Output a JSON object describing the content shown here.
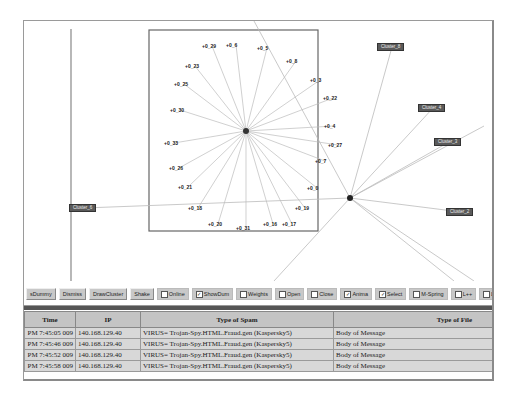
{
  "graph": {
    "center_node": {
      "x": 222,
      "y": 110
    },
    "hub_node": {
      "x": 326,
      "y": 177
    },
    "inner_box": {
      "x": 125,
      "y": 9,
      "w": 169,
      "h": 201
    },
    "node_labels": [
      {
        "text": "+0_29",
        "x": 53,
        "y": 13
      },
      {
        "text": "+0_6",
        "x": 77,
        "y": 12
      },
      {
        "text": "+0_5",
        "x": 108,
        "y": 15
      },
      {
        "text": "+0_8",
        "x": 137,
        "y": 28
      },
      {
        "text": "+0_23",
        "x": 36,
        "y": 33
      },
      {
        "text": "+0_3",
        "x": 161,
        "y": 47
      },
      {
        "text": "+0_25",
        "x": 25,
        "y": 51
      },
      {
        "text": "+0_22",
        "x": 174,
        "y": 65
      },
      {
        "text": "+0_30",
        "x": 21,
        "y": 77
      },
      {
        "text": "+0_4",
        "x": 175,
        "y": 93
      },
      {
        "text": "+0_27",
        "x": 179,
        "y": 112
      },
      {
        "text": "+0_33",
        "x": 15,
        "y": 110
      },
      {
        "text": "+0_7",
        "x": 166,
        "y": 128
      },
      {
        "text": "+0_26",
        "x": 20,
        "y": 135
      },
      {
        "text": "+0_21",
        "x": 29,
        "y": 154
      },
      {
        "text": "+0_0",
        "x": 158,
        "y": 155
      },
      {
        "text": "+0_18",
        "x": 39,
        "y": 175
      },
      {
        "text": "+0_19",
        "x": 146,
        "y": 175
      },
      {
        "text": "+0_20",
        "x": 59,
        "y": 191
      },
      {
        "text": "+0_31",
        "x": 87,
        "y": 195
      },
      {
        "text": "+0_16",
        "x": 114,
        "y": 191
      },
      {
        "text": "+0_17",
        "x": 133,
        "y": 191
      }
    ],
    "clusters": [
      {
        "text": "Cluster_8",
        "x": 353,
        "y": 22
      },
      {
        "text": "Cluster_4",
        "x": 394,
        "y": 83
      },
      {
        "text": "Cluster_3",
        "x": 410,
        "y": 117
      },
      {
        "text": "Cluster_2",
        "x": 422,
        "y": 187
      },
      {
        "text": "Cluster_6",
        "x": 45,
        "y": 183
      }
    ]
  },
  "toolbar": {
    "buttons": [
      "sDummy",
      "Dismiss",
      "DrawCluster",
      "Shake"
    ],
    "checkboxes": [
      {
        "label": "Online",
        "checked": false
      },
      {
        "label": "ShowDum",
        "checked": true
      },
      {
        "label": "Weights",
        "checked": false
      },
      {
        "label": "Open",
        "checked": false
      },
      {
        "label": "Close",
        "checked": false
      },
      {
        "label": "Anima",
        "checked": true
      },
      {
        "label": "Select",
        "checked": true
      },
      {
        "label": "M-Spring",
        "checked": false
      },
      {
        "label": "L++",
        "checked": false
      },
      {
        "label": "L--",
        "checked": false
      },
      {
        "label": "Der",
        "checked": false
      }
    ]
  },
  "table": {
    "headers": [
      "Time",
      "IP",
      "Type of Spam",
      "Type of File"
    ],
    "rows": [
      [
        "009 7:45:05 PM",
        "140.168.129.40",
        "VIRUS= Trojan-Spy.HTML.Fraud.gen (Kaspersky5)",
        "Body of Message"
      ],
      [
        "009 7:45:46 PM",
        "140.168.129.40",
        "VIRUS= Trojan-Spy.HTML.Fraud.gen (Kaspersky5)",
        "Body of Message"
      ],
      [
        "009 7:45:52 PM",
        "140.168.129.40",
        "VIRUS= Trojan-Spy.HTML.Fraud.gen (Kaspersky5)",
        "Body of Message"
      ],
      [
        "009 7:45:58 PM",
        "140.168.129.40",
        "VIRUS= Trojan-Spy.HTML.Fraud.gen (Kaspersky5)",
        "Body of Message"
      ]
    ]
  }
}
